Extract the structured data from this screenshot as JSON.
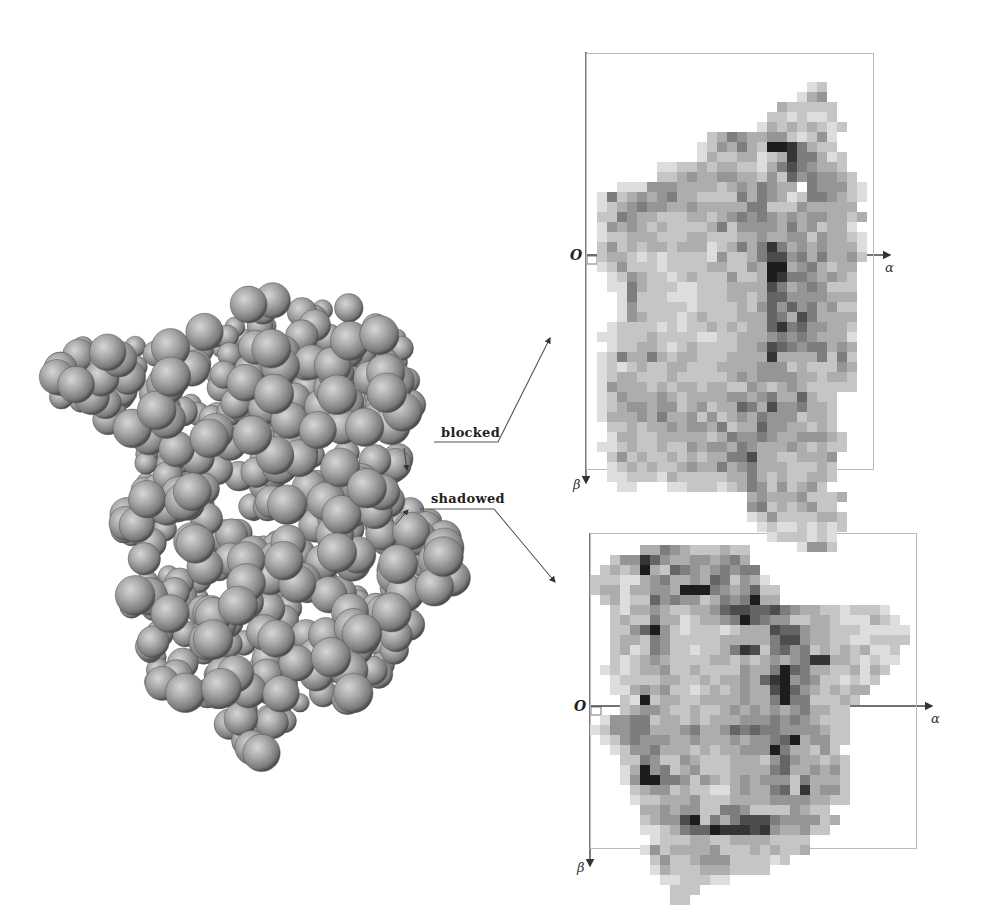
{
  "figure": {
    "labels": {
      "blocked": "blocked",
      "shadowed": "shadowed"
    },
    "protein": {
      "description": "space-filling molecular model (grey spheres)",
      "sphere_color": "#9a9a9a"
    }
  },
  "chart_data": [
    {
      "type": "heatmap",
      "title": "blocked",
      "xlabel": "α",
      "ylabel": "β",
      "origin_label": "O",
      "cell_px": 10,
      "grid_origin_px": [
        587,
        62
      ],
      "legend": "darker = higher density",
      "rows": [
        "0000000000000000000000000000",
        "0000000000000000000000000000",
        "0000000000000000000000120000",
        "0000000000000000000001340000",
        "0000000000000000000322222000",
        "0000000000000000002212112000",
        "0000000000000000013232321200",
        "0000000000002354334421241000",
        "0000000000012435329985322000",
        "0000000000013223312385531200",
        "0000000112232332213575433200",
        "0000000223433443324264544320",
        "0001114443333234354330544421",
        "0152343453322225354312554321",
        "0123454433433333552224333330",
        "0225433222332345454343443323",
        "0143432322223524444353423310",
        "0122333222332223343344243321",
        "0242323323331235358534343331",
        "0233212122221422357745353342",
        "0124222122223322439934532330",
        "0012432212322242239855434320",
        "0011532221122233337534542220",
        "0001522211122233236644443330",
        "0001422222122223246464534220",
        "0001432221232223336537533330",
        "0012222121223232336856443320",
        "0112223222211223334545433310",
        "0012233212322223347654553430",
        "0125335323322233338333352520",
        "0121232233222333344423222430",
        "0123322232222234344443323320",
        "0143332323323322432343222220",
        "0124333432333344345336322000",
        "0123443442342336537445332000",
        "0133343533424234354442332000",
        "0022323343443523364433232000",
        "0013322333332354454334443200",
        "0112322322434435433343232200",
        "0024232232323355733223334000"
      ],
      "rows_lower": [
        "0012323223433534533322232000",
        "0011222132222233532322332000",
        "0001100011222123542423420000",
        "0000000000000000343334222300",
        "0000000000000000452323422000",
        "0000000000000000124222233200",
        "0000000000000000012112121200",
        "0000000000000000001222121000",
        "0000000000000000000001442000"
      ]
    },
    {
      "type": "heatmap",
      "title": "shadowed",
      "xlabel": "α",
      "ylabel": "β",
      "origin_label": "O",
      "cell_px": 10,
      "grid_origin_px": [
        590,
        545
      ],
      "legend": "darker = higher density",
      "rows": [
        "00000335432223220000000000000000",
        "00244864334434530000000000000000",
        "02323932654345455000000000000000",
        "22211345334365243100000000000000",
        "23313344399954346220000000000000",
        "02312264544235459330000000000000",
        "00213343223346776675433221222100",
        "00232253312334596544223321113210",
        "00224694212221233376643322211111",
        "00233254222223333357743322112222",
        "00231254221223587256452323231120",
        "00212343222233232343458833212110",
        "01212334223222243359653322313200",
        "00122223322323343689454221212000",
        "00113434221232343379643232330000",
        "00021923322333343359552223200000",
        "00023443223223434343453322000000",
        "01445523323233344454543222000000",
        "12445533345334656554444322000000",
        "01245444334333434456934422000000",
        "00124453332323344495332420000000",
        "00022542243222333246433232000000",
        "00013945234222333356334342000000",
        "00014995542432343444253332000000",
        "00002344232211343356283442000000",
        "00001223334222333344443322000000",
        "00000334344225542222432200000000",
        "00000234479253577754444230000000",
        "00000112356698887843342200000000",
        "00000012223322333322220000000000"
      ],
      "rows_lower": [
        "00000142333342223232230000000000",
        "00000024223444222212000000000000",
        "00000013222333222200000000000000",
        "00000001122211000000000000000000",
        "00000000222000000000000000000000",
        "00000000220000000000000000000000"
      ]
    }
  ]
}
